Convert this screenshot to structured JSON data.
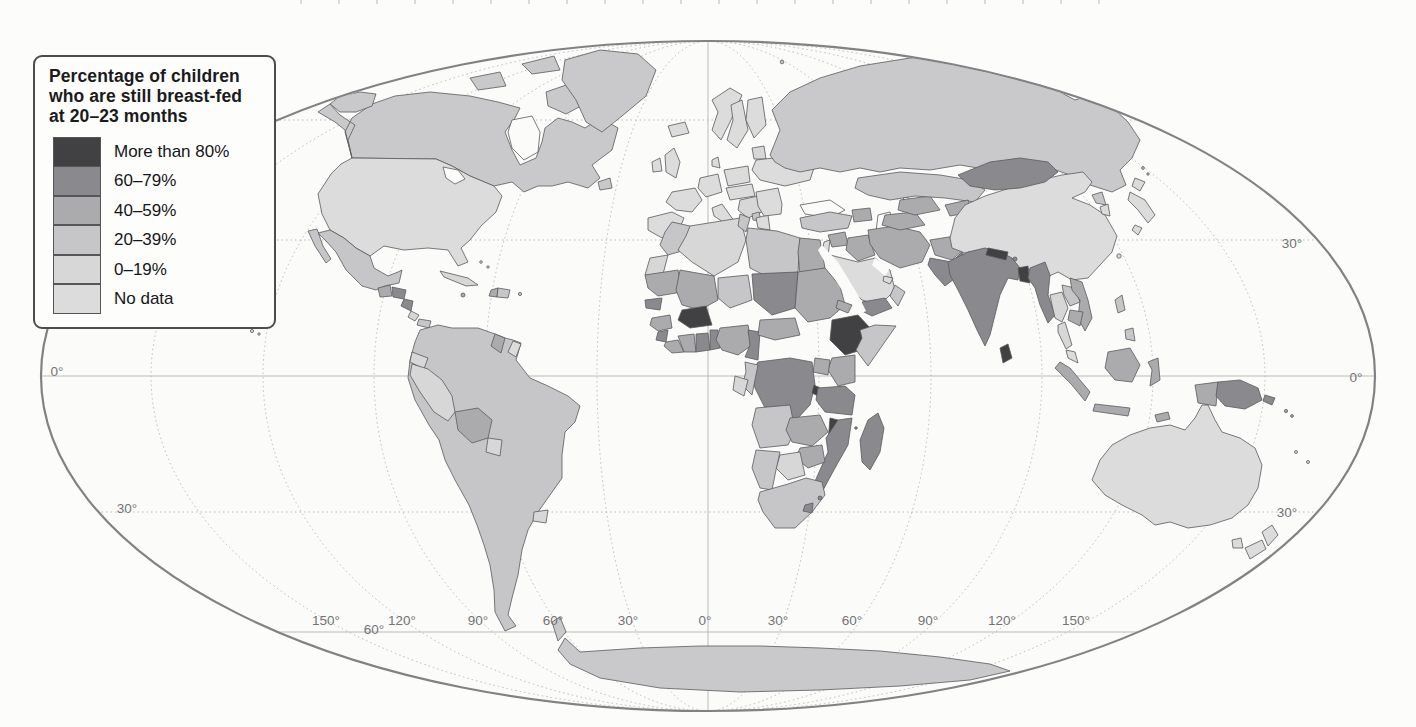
{
  "page": {
    "background": "#fcfcfa"
  },
  "colors": {
    "cat80": "#414042",
    "cat60": "#8a898d",
    "cat40": "#ababae",
    "cat20": "#c6c6c8",
    "cat0": "#d7d7d8",
    "nodata": "#dcdcdd",
    "nodataMid": "#c9c9cb",
    "sea": "#fbfbf9",
    "border": "#5a595c",
    "graticule": "#b3b3b3",
    "ellipseOutline": "#828285"
  },
  "legend": {
    "title_lines": [
      "Percentage of children",
      "who are still breast-fed",
      "at 20–23 months"
    ],
    "items": [
      {
        "label": "More than 80%",
        "color": "#414042"
      },
      {
        "label": "60–79%",
        "color": "#8a898d"
      },
      {
        "label": "40–59%",
        "color": "#ababae"
      },
      {
        "label": "20–39%",
        "color": "#c6c6c8"
      },
      {
        "label": "0–19%",
        "color": "#d7d7d8"
      },
      {
        "label": "No data",
        "color": "#dcdcdd"
      }
    ]
  },
  "map": {
    "projection_labels": {
      "latitude": [
        "30°",
        "0°",
        "0°",
        "30°",
        "30°",
        "60°"
      ],
      "longitude": [
        "150°",
        "120°",
        "90°",
        "60°",
        "30°",
        "0°",
        "30°",
        "60°",
        "90°",
        "120°",
        "150°"
      ]
    },
    "regions_by_category": {
      "more_than_80": [
        "Burkina Faso",
        "Ethiopia",
        "Malawi",
        "Rwanda-Burundi",
        "Nepal",
        "Bangladesh",
        "Sri Lanka"
      ],
      "60_79": [
        "Senegal",
        "Sierra Leone",
        "Ghana",
        "Togo-Benin",
        "Chad",
        "Cameroon",
        "DR Congo",
        "Tanzania",
        "Mozambique",
        "Madagascar",
        "Lesotho",
        "Yemen",
        "Pakistan",
        "India",
        "Myanmar",
        "Mongolia",
        "Papua New Guinea",
        "Honduras",
        "Nicaragua"
      ],
      "40_59": [
        "Mauritania",
        "Mali",
        "Guinea",
        "Liberia",
        "Cote d'Ivoire",
        "Nigeria",
        "Central African Republic",
        "Egypt",
        "Sudan",
        "Eritrea",
        "Kenya",
        "Uganda",
        "Zambia",
        "Zimbabwe",
        "Syria",
        "Iraq",
        "Iran",
        "Afghanistan",
        "Turkmenistan",
        "Uzbekistan",
        "Vietnam",
        "Cambodia",
        "Indonesia",
        "Bolivia",
        "Guyana",
        "Guatemala",
        "Haiti",
        "Caucasus"
      ],
      "20_39": [
        "Mexico",
        "Panama",
        "Dominican Republic",
        "Colombia",
        "Venezuela",
        "Suriname",
        "Brazil",
        "Chile",
        "Argentina",
        "Morocco",
        "Tunisia",
        "Libya",
        "Niger",
        "Somalia",
        "Congo",
        "Angola",
        "Namibia",
        "South Africa",
        "Turkey",
        "Oman",
        "Kazakhstan",
        "Laos",
        "Philippines",
        "North Korea"
      ],
      "0_19": [
        "Cuba",
        "Costa Rica",
        "Ecuador",
        "Peru",
        "Paraguay",
        "Uruguay",
        "Algeria",
        "Western Sahara",
        "Gabon",
        "Botswana",
        "Thailand",
        "Baltic states"
      ],
      "no_data": [
        "United States",
        "Canada",
        "Greenland",
        "Iceland",
        "Western Europe",
        "Scandinavia",
        "Russia",
        "Saudi Arabia",
        "China",
        "Japan",
        "South Korea",
        "Taiwan",
        "Malaysia",
        "Australia",
        "New Zealand",
        "Antarctica"
      ]
    }
  }
}
